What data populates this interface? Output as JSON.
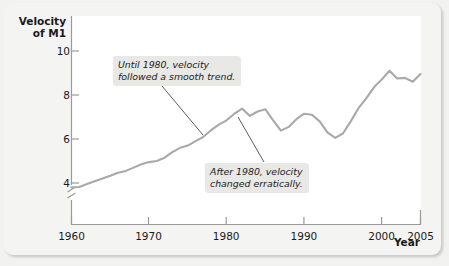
{
  "figure": {
    "y_axis_title": "Velocity\nof M1",
    "x_axis_title": "Year"
  },
  "annotations": {
    "first": "Until 1980, velocity\nfollowed a smooth trend.",
    "second": "After 1980, velocity\nchanged erratically."
  },
  "colors": {
    "line": "#a9a9a7",
    "panel": "#ffffff",
    "card": "#f4f4f2",
    "annotation_bg": "#e8e8e6",
    "axis": "#9a9a98",
    "text": "#1a1a1a"
  },
  "chart_data": {
    "type": "line",
    "title": "",
    "subtitle": "",
    "xlabel": "Year",
    "ylabel": "Velocity of M1",
    "xlim": [
      1960,
      2005
    ],
    "ylim": [
      3.2,
      10.6
    ],
    "y_axis_break": true,
    "grid": false,
    "legend": null,
    "xticks": [
      1960,
      1970,
      1980,
      1990,
      2000,
      2005
    ],
    "xtick_labels": [
      "1960",
      "1970",
      "1980",
      "1990",
      "2000",
      "2005"
    ],
    "yticks": [
      4,
      6,
      8,
      10
    ],
    "ytick_labels": [
      "4",
      "6",
      "8",
      "10"
    ],
    "series": [
      {
        "name": "Velocity of M1",
        "x": [
          1960,
          1961,
          1962,
          1963,
          1964,
          1965,
          1966,
          1967,
          1968,
          1969,
          1970,
          1971,
          1972,
          1973,
          1974,
          1975,
          1976,
          1977,
          1978,
          1979,
          1980,
          1981,
          1982,
          1983,
          1984,
          1985,
          1986,
          1987,
          1988,
          1989,
          1990,
          1991,
          1992,
          1993,
          1994,
          1995,
          1996,
          1997,
          1998,
          1999,
          2000,
          2001,
          2002,
          2003,
          2004,
          2005
        ],
        "values": [
          3.8,
          3.82,
          3.95,
          4.08,
          4.2,
          4.33,
          4.47,
          4.55,
          4.7,
          4.85,
          4.95,
          5.0,
          5.15,
          5.4,
          5.6,
          5.7,
          5.9,
          6.1,
          6.4,
          6.65,
          6.85,
          7.15,
          7.38,
          7.05,
          7.25,
          7.35,
          6.85,
          6.38,
          6.55,
          6.9,
          7.15,
          7.1,
          6.8,
          6.3,
          6.05,
          6.25,
          6.8,
          7.4,
          7.85,
          8.35,
          8.7,
          9.1,
          8.75,
          8.78,
          8.6,
          8.95
        ]
      }
    ],
    "annotations": [
      {
        "text": "Until 1980, velocity followed a smooth trend.",
        "points_to_year": 1976,
        "points_to_value": 6.05
      },
      {
        "text": "After 1980, velocity changed erratically.",
        "points_to_year": 1983,
        "points_to_value": 7.05
      }
    ]
  }
}
